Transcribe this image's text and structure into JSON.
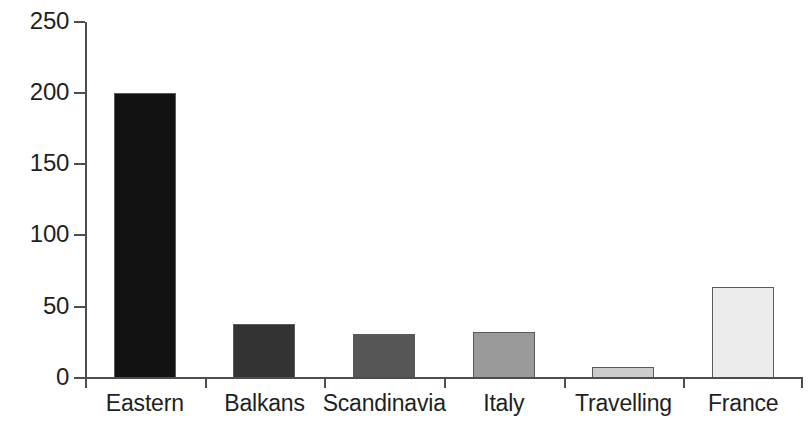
{
  "chart_data": {
    "type": "bar",
    "title": "",
    "subtitle": "",
    "xlabel": "",
    "ylabel": "",
    "categories": [
      "Eastern",
      "Balkans",
      "Scandinavia",
      "Italy",
      "Travelling",
      "France"
    ],
    "values": [
      200,
      38,
      31,
      32,
      8,
      64
    ],
    "series": [
      {
        "name": "",
        "values": [
          200,
          38,
          31,
          32,
          8,
          64
        ]
      }
    ],
    "bar_colors": [
      "#121212",
      "#333333",
      "#565656",
      "#9a9a9a",
      "#cccccc",
      "#ececec"
    ],
    "bar_border_color": "#5a5a5a",
    "ylim": [
      0,
      250
    ],
    "yticks": [
      0,
      50,
      100,
      150,
      200,
      250
    ],
    "ytick_labels": [
      "0",
      "50",
      "100",
      "150",
      "200",
      "250"
    ],
    "grid": false,
    "legend": false,
    "legend_position": "none",
    "axis_color": "#4d4d4d",
    "background_color": "#ffffff",
    "text_color": "#1f1f1f"
  }
}
